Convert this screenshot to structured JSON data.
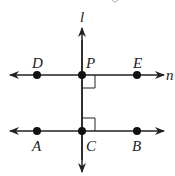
{
  "diagram": {
    "type": "geometry-perpendicular-lines",
    "lines": [
      {
        "name": "l",
        "label": "l",
        "orientation": "vertical"
      },
      {
        "name": "n",
        "label": "n",
        "orientation": "horizontal",
        "points": [
          "D",
          "P",
          "E"
        ]
      },
      {
        "name": "AB",
        "label": "",
        "orientation": "horizontal",
        "points": [
          "A",
          "C",
          "B"
        ]
      }
    ],
    "points": {
      "D": {
        "label": "D"
      },
      "P": {
        "label": "P"
      },
      "E": {
        "label": "E"
      },
      "A": {
        "label": "A"
      },
      "C": {
        "label": "C"
      },
      "B": {
        "label": "B"
      }
    },
    "right_angles": [
      "P",
      "C"
    ],
    "line_label_l": "l",
    "line_label_n": "n"
  },
  "colors": {
    "stroke": "#222222",
    "background": "#ffffff"
  }
}
